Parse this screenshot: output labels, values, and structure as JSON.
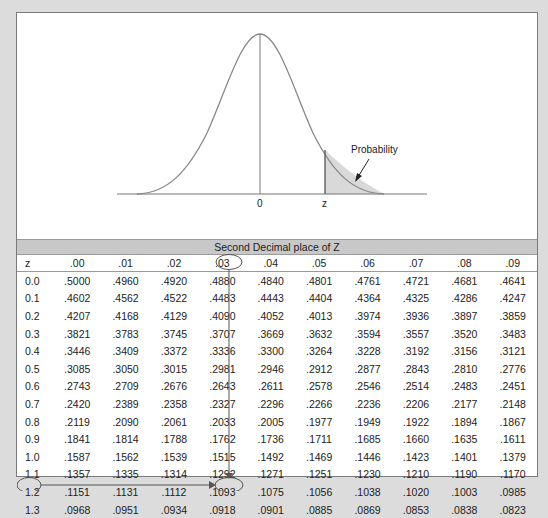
{
  "plot": {
    "axis_labels": {
      "mean": "0",
      "z": "z"
    },
    "annotation": "Probability"
  },
  "table": {
    "band_title": "Second Decimal place of Z",
    "z_header": "z",
    "columns": [
      ".00",
      ".01",
      ".02",
      ".03",
      ".04",
      ".05",
      ".06",
      ".07",
      ".08",
      ".09"
    ],
    "rows": [
      {
        "z": "0.0",
        "v": [
          ".5000",
          ".4960",
          ".4920",
          ".4880",
          ".4840",
          ".4801",
          ".4761",
          ".4721",
          ".4681",
          ".4641"
        ]
      },
      {
        "z": "0.1",
        "v": [
          ".4602",
          ".4562",
          ".4522",
          ".4483",
          ".4443",
          ".4404",
          ".4364",
          ".4325",
          ".4286",
          ".4247"
        ]
      },
      {
        "z": "0.2",
        "v": [
          ".4207",
          ".4168",
          ".4129",
          ".4090",
          ".4052",
          ".4013",
          ".3974",
          ".3936",
          ".3897",
          ".3859"
        ]
      },
      {
        "z": "0.3",
        "v": [
          ".3821",
          ".3783",
          ".3745",
          ".3707",
          ".3669",
          ".3632",
          ".3594",
          ".3557",
          ".3520",
          ".3483"
        ]
      },
      {
        "z": "0.4",
        "v": [
          ".3446",
          ".3409",
          ".3372",
          ".3336",
          ".3300",
          ".3264",
          ".3228",
          ".3192",
          ".3156",
          ".3121"
        ]
      },
      {
        "z": "0.5",
        "v": [
          ".3085",
          ".3050",
          ".3015",
          ".2981",
          ".2946",
          ".2912",
          ".2877",
          ".2843",
          ".2810",
          ".2776"
        ]
      },
      {
        "z": "0.6",
        "v": [
          ".2743",
          ".2709",
          ".2676",
          ".2643",
          ".2611",
          ".2578",
          ".2546",
          ".2514",
          ".2483",
          ".2451"
        ]
      },
      {
        "z": "0.7",
        "v": [
          ".2420",
          ".2389",
          ".2358",
          ".2327",
          ".2296",
          ".2266",
          ".2236",
          ".2206",
          ".2177",
          ".2148"
        ]
      },
      {
        "z": "0.8",
        "v": [
          ".2119",
          ".2090",
          ".2061",
          ".2033",
          ".2005",
          ".1977",
          ".1949",
          ".1922",
          ".1894",
          ".1867"
        ]
      },
      {
        "z": "0.9",
        "v": [
          ".1841",
          ".1814",
          ".1788",
          ".1762",
          ".1736",
          ".1711",
          ".1685",
          ".1660",
          ".1635",
          ".1611"
        ]
      },
      {
        "z": "1.0",
        "v": [
          ".1587",
          ".1562",
          ".1539",
          ".1515",
          ".1492",
          ".1469",
          ".1446",
          ".1423",
          ".1401",
          ".1379"
        ]
      },
      {
        "z": "1.1",
        "v": [
          ".1357",
          ".1335",
          ".1314",
          ".1292",
          ".1271",
          ".1251",
          ".1230",
          ".1210",
          ".1190",
          ".1170"
        ]
      },
      {
        "z": "1.2",
        "v": [
          ".1151",
          ".1131",
          ".1112",
          ".1093",
          ".1075",
          ".1056",
          ".1038",
          ".1020",
          ".1003",
          ".0985"
        ]
      },
      {
        "z": "1.3",
        "v": [
          ".0968",
          ".0951",
          ".0934",
          ".0918",
          ".0901",
          ".0885",
          ".0869",
          ".0853",
          ".0838",
          ".0823"
        ]
      }
    ],
    "highlight": {
      "row": "1.3",
      "column": ".03",
      "value": ".0918"
    }
  },
  "colors": {
    "background": "#dcdcdc",
    "curve": "#777777",
    "shade": "#d9d9d9",
    "band": "#c8c8c8"
  },
  "chart_data": {
    "type": "table",
    "figure": {
      "type": "line",
      "description": "Standard normal bell curve with shaded right tail beyond z",
      "x_tick_labels": [
        "0",
        "z"
      ],
      "annotation": "Probability"
    },
    "row_header": "z",
    "column_group_title": "Second Decimal place of Z",
    "columns": [
      ".00",
      ".01",
      ".02",
      ".03",
      ".04",
      ".05",
      ".06",
      ".07",
      ".08",
      ".09"
    ],
    "row_labels": [
      "0.0",
      "0.1",
      "0.2",
      "0.3",
      "0.4",
      "0.5",
      "0.6",
      "0.7",
      "0.8",
      "0.9",
      "1.0",
      "1.1",
      "1.2",
      "1.3"
    ],
    "values": [
      [
        0.5,
        0.496,
        0.492,
        0.488,
        0.484,
        0.4801,
        0.4761,
        0.4721,
        0.4681,
        0.4641
      ],
      [
        0.4602,
        0.4562,
        0.4522,
        0.4483,
        0.4443,
        0.4404,
        0.4364,
        0.4325,
        0.4286,
        0.4247
      ],
      [
        0.4207,
        0.4168,
        0.4129,
        0.409,
        0.4052,
        0.4013,
        0.3974,
        0.3936,
        0.3897,
        0.3859
      ],
      [
        0.3821,
        0.3783,
        0.3745,
        0.3707,
        0.3669,
        0.3632,
        0.3594,
        0.3557,
        0.352,
        0.3483
      ],
      [
        0.3446,
        0.3409,
        0.3372,
        0.3336,
        0.33,
        0.3264,
        0.3228,
        0.3192,
        0.3156,
        0.3121
      ],
      [
        0.3085,
        0.305,
        0.3015,
        0.2981,
        0.2946,
        0.2912,
        0.2877,
        0.2843,
        0.281,
        0.2776
      ],
      [
        0.2743,
        0.2709,
        0.2676,
        0.2643,
        0.2611,
        0.2578,
        0.2546,
        0.2514,
        0.2483,
        0.2451
      ],
      [
        0.242,
        0.2389,
        0.2358,
        0.2327,
        0.2296,
        0.2266,
        0.2236,
        0.2206,
        0.2177,
        0.2148
      ],
      [
        0.2119,
        0.209,
        0.2061,
        0.2033,
        0.2005,
        0.1977,
        0.1949,
        0.1922,
        0.1894,
        0.1867
      ],
      [
        0.1841,
        0.1814,
        0.1788,
        0.1762,
        0.1736,
        0.1711,
        0.1685,
        0.166,
        0.1635,
        0.1611
      ],
      [
        0.1587,
        0.1562,
        0.1539,
        0.1515,
        0.1492,
        0.1469,
        0.1446,
        0.1423,
        0.1401,
        0.1379
      ],
      [
        0.1357,
        0.1335,
        0.1314,
        0.1292,
        0.1271,
        0.1251,
        0.123,
        0.121,
        0.119,
        0.117
      ],
      [
        0.1151,
        0.1131,
        0.1112,
        0.1093,
        0.1075,
        0.1056,
        0.1038,
        0.102,
        0.1003,
        0.0985
      ],
      [
        0.0968,
        0.0951,
        0.0934,
        0.0918,
        0.0901,
        0.0885,
        0.0869,
        0.0853,
        0.0838,
        0.0823
      ]
    ],
    "highlight": {
      "row": "1.3",
      "column": ".03",
      "value": 0.0918
    }
  }
}
